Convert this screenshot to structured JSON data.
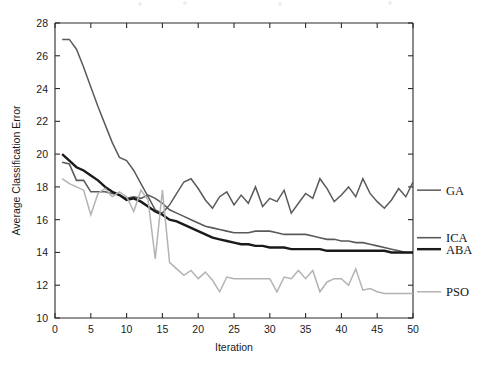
{
  "chart_data": {
    "type": "line",
    "title": "",
    "xlabel": "Iteration",
    "ylabel": "Average Classification Error",
    "xlim": [
      0,
      50
    ],
    "ylim": [
      10,
      28
    ],
    "xticks": [
      0,
      5,
      10,
      15,
      20,
      25,
      30,
      35,
      40,
      45,
      50
    ],
    "yticks": [
      10,
      12,
      14,
      16,
      18,
      20,
      22,
      24,
      26,
      28
    ],
    "xtick_labels": [
      "0",
      "5",
      "10",
      "15",
      "20",
      "25",
      "30",
      "35",
      "40",
      "45",
      "50"
    ],
    "ytick_labels": [
      "10",
      "12",
      "14",
      "16",
      "18",
      "20",
      "22",
      "24",
      "26",
      "28"
    ],
    "grid": false,
    "legend_position": "right-outside",
    "x": [
      1,
      2,
      3,
      4,
      5,
      6,
      7,
      8,
      9,
      10,
      11,
      12,
      13,
      14,
      15,
      16,
      17,
      18,
      19,
      20,
      21,
      22,
      23,
      24,
      25,
      26,
      27,
      28,
      29,
      30,
      31,
      32,
      33,
      34,
      35,
      36,
      37,
      38,
      39,
      40,
      41,
      42,
      43,
      44,
      45,
      46,
      47,
      48,
      49,
      50
    ],
    "series": [
      {
        "name": "GA",
        "color": "#5a5a5a",
        "width": 1.5,
        "values": [
          27.0,
          27.0,
          26.4,
          25.3,
          24.1,
          22.9,
          21.8,
          20.7,
          19.8,
          19.6,
          19.0,
          18.2,
          17.4,
          16.6,
          16.4,
          16.9,
          17.6,
          18.3,
          18.5,
          17.9,
          17.2,
          16.7,
          17.4,
          17.7,
          16.9,
          17.5,
          17.0,
          18.0,
          16.8,
          17.3,
          17.1,
          17.8,
          16.4,
          17.0,
          17.6,
          17.3,
          18.5,
          17.9,
          17.1,
          17.5,
          18.0,
          17.4,
          18.5,
          17.6,
          17.1,
          16.7,
          17.2,
          17.9,
          17.4,
          18.3
        ]
      },
      {
        "name": "ICA",
        "color": "#5a5a5a",
        "width": 1.6,
        "values": [
          19.5,
          19.4,
          18.4,
          18.4,
          17.7,
          17.7,
          17.7,
          17.6,
          17.5,
          17.3,
          17.4,
          17.3,
          17.5,
          17.3,
          17.0,
          16.6,
          16.4,
          16.2,
          16.0,
          15.8,
          15.6,
          15.5,
          15.4,
          15.3,
          15.2,
          15.2,
          15.2,
          15.3,
          15.3,
          15.3,
          15.2,
          15.1,
          15.1,
          15.1,
          15.1,
          15.0,
          14.9,
          14.8,
          14.8,
          14.7,
          14.7,
          14.6,
          14.6,
          14.5,
          14.4,
          14.3,
          14.2,
          14.1,
          14.0,
          14.0
        ]
      },
      {
        "name": "ABA",
        "color": "#1a1a1a",
        "width": 2.4,
        "values": [
          20.0,
          19.6,
          19.2,
          19.0,
          18.7,
          18.4,
          18.0,
          17.7,
          17.5,
          17.2,
          17.3,
          17.1,
          16.8,
          16.5,
          16.3,
          16.0,
          15.9,
          15.7,
          15.5,
          15.3,
          15.1,
          14.9,
          14.8,
          14.7,
          14.6,
          14.5,
          14.5,
          14.4,
          14.4,
          14.3,
          14.3,
          14.3,
          14.2,
          14.2,
          14.2,
          14.2,
          14.2,
          14.1,
          14.1,
          14.1,
          14.1,
          14.1,
          14.1,
          14.1,
          14.1,
          14.1,
          14.0,
          14.0,
          14.0,
          14.0
        ]
      },
      {
        "name": "PSO",
        "color": "#b3b3b3",
        "width": 1.5,
        "values": [
          18.5,
          18.2,
          18.0,
          17.8,
          16.3,
          17.6,
          17.9,
          17.4,
          17.7,
          17.4,
          16.5,
          17.8,
          17.2,
          13.6,
          17.8,
          13.4,
          13.0,
          12.6,
          12.9,
          12.4,
          12.8,
          12.3,
          11.6,
          12.5,
          12.4,
          12.4,
          12.4,
          12.4,
          12.4,
          12.4,
          11.6,
          12.5,
          12.4,
          12.9,
          12.4,
          12.9,
          11.6,
          12.2,
          12.4,
          12.4,
          12.0,
          13.0,
          11.7,
          11.8,
          11.6,
          11.5,
          11.5,
          11.5,
          11.5,
          11.5
        ]
      }
    ]
  },
  "legend": {
    "items": [
      {
        "label": "GA",
        "y_value": 17.8
      },
      {
        "label": "ICA",
        "y_value": 14.9
      },
      {
        "label": "ABA",
        "y_value": 14.2
      },
      {
        "label": "PSO",
        "y_value": 11.6
      }
    ]
  }
}
